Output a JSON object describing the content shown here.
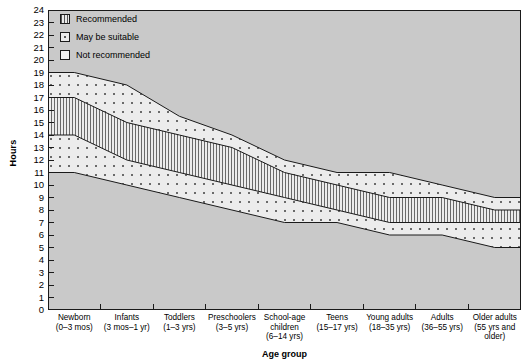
{
  "chart_data": {
    "type": "area",
    "title": "",
    "xlabel": "Age group",
    "ylabel": "Hours",
    "ylim": [
      0,
      24
    ],
    "ytick_step": 1,
    "grid": false,
    "legend_position": "top-left",
    "categories": [
      "Newborn",
      "Infants",
      "Toddlers",
      "Preschoolers",
      "School-age children",
      "Teens",
      "Young adults",
      "Adults",
      "Older adults"
    ],
    "category_ranges": [
      "(0–3 mos)",
      "(3 mos–1 yr)",
      "(1–3 yrs)",
      "(3–5 yrs)",
      "(6–14 yrs)",
      "(15–17 yrs)",
      "(18–35 yrs)",
      "(36–55 yrs)",
      "(55 yrs and older)"
    ],
    "category_labels_wrapped": [
      [
        "Newborn",
        "(0–3 mos)"
      ],
      [
        "Infants",
        "(3 mos–1 yr)"
      ],
      [
        "Toddlers",
        "(1–3 yrs)"
      ],
      [
        "Preschoolers",
        "(3–5 yrs)"
      ],
      [
        "School-age",
        "children",
        "(6–14 yrs)"
      ],
      [
        "Teens",
        "(15–17 yrs)"
      ],
      [
        "Young adults",
        "(18–35 yrs)"
      ],
      [
        "Adults",
        "(36–55 yrs)"
      ],
      [
        "Older adults",
        "(55 yrs and",
        "older)"
      ]
    ],
    "ytick_labels": [
      "0",
      "1",
      "2",
      "3",
      "4",
      "5",
      "6",
      "7",
      "8",
      "9",
      "10",
      "11",
      "12",
      "13",
      "14",
      "15",
      "16",
      "17",
      "18",
      "19",
      "20",
      "21",
      "22",
      "23",
      "24"
    ],
    "series": [
      {
        "name": "may_be_suitable_upper",
        "description": "Upper bound of 'May be suitable' band (hours)",
        "values": [
          19,
          18,
          15.5,
          14,
          12,
          11,
          11,
          10,
          9
        ]
      },
      {
        "name": "recommended_upper",
        "description": "Upper bound of 'Recommended' band (hours)",
        "values": [
          17,
          15,
          14,
          13,
          11,
          10,
          9,
          9,
          8
        ]
      },
      {
        "name": "recommended_lower",
        "description": "Lower bound of 'Recommended' band (hours)",
        "values": [
          14,
          12,
          11,
          10,
          9,
          8,
          7,
          7,
          7
        ]
      },
      {
        "name": "may_be_suitable_lower",
        "description": "Lower bound of 'May be suitable' band (hours)",
        "values": [
          11,
          10,
          9,
          8,
          7,
          7,
          6,
          6,
          5
        ]
      }
    ],
    "bands": [
      {
        "name": "Recommended",
        "pattern": "vertical-lines"
      },
      {
        "name": "May be suitable",
        "pattern": "dotted"
      },
      {
        "name": "Not recommended",
        "pattern": "plain"
      }
    ]
  },
  "legend": {
    "items": [
      {
        "label": "Recommended",
        "pattern": "vertical-lines"
      },
      {
        "label": "May be suitable",
        "pattern": "dotted"
      },
      {
        "label": "Not recommended",
        "pattern": "plain"
      }
    ]
  },
  "axes": {
    "y_title": "Hours",
    "x_title": "Age group"
  },
  "colors": {
    "plot_background": "#c9c9c9",
    "band_fill": "#ececec",
    "line": "#1a1a1a",
    "pattern": "#6e6e6e",
    "text": "#000000"
  }
}
